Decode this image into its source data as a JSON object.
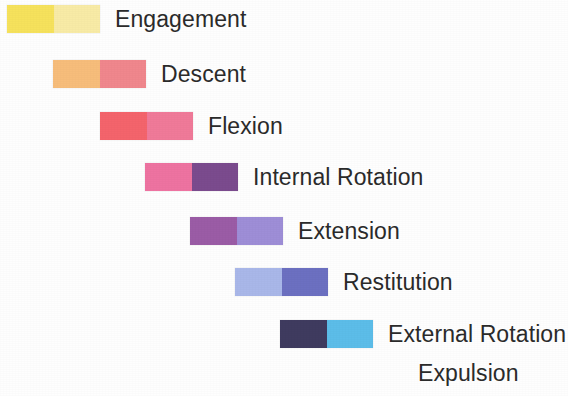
{
  "figure": {
    "background_color": "#fefefe",
    "text_color": "#2b2b2b",
    "bar_width_px": 93,
    "bar_height_px": 28
  },
  "rows": [
    {
      "label": "Engagement",
      "has_swatch": true,
      "left_color": "#f6e25c",
      "right_color": "#f8eba6",
      "x": 7,
      "y": 5,
      "label_x": 113,
      "label_baseline_y": 30
    },
    {
      "label": "Descent",
      "has_swatch": true,
      "left_color": "#f7bd7b",
      "right_color": "#f0878d",
      "x": 53,
      "y": 60,
      "label_x": 158,
      "label_baseline_y": 85
    },
    {
      "label": "Flexion",
      "has_swatch": true,
      "left_color": "#f4646c",
      "right_color": "#f07a99",
      "x": 100,
      "y": 112,
      "label_x": 203,
      "label_baseline_y": 137
    },
    {
      "label": "Internal Rotation",
      "has_swatch": true,
      "left_color": "#ee73a1",
      "right_color": "#7b4b8e",
      "x": 145,
      "y": 163,
      "label_x": 248,
      "label_baseline_y": 188
    },
    {
      "label": "Extension",
      "has_swatch": true,
      "left_color": "#9b5ca6",
      "right_color": "#9e8ed7",
      "x": 190,
      "y": 217,
      "label_x": 293,
      "label_baseline_y": 242
    },
    {
      "label": "Restitution",
      "has_swatch": true,
      "left_color": "#a9b7e9",
      "right_color": "#6c70c1",
      "x": 235,
      "y": 268,
      "label_x": 343,
      "label_baseline_y": 293
    },
    {
      "label": "External Rotation",
      "has_swatch": true,
      "left_color": "#3f3b5f",
      "right_color": "#5cbde9",
      "x": 280,
      "y": 320,
      "label_x": 388,
      "label_baseline_y": 345
    },
    {
      "label": "Expulsion",
      "has_swatch": false,
      "left_color": null,
      "right_color": null,
      "x": 418,
      "y": 362,
      "label_x": 418,
      "label_baseline_y": 387
    }
  ]
}
